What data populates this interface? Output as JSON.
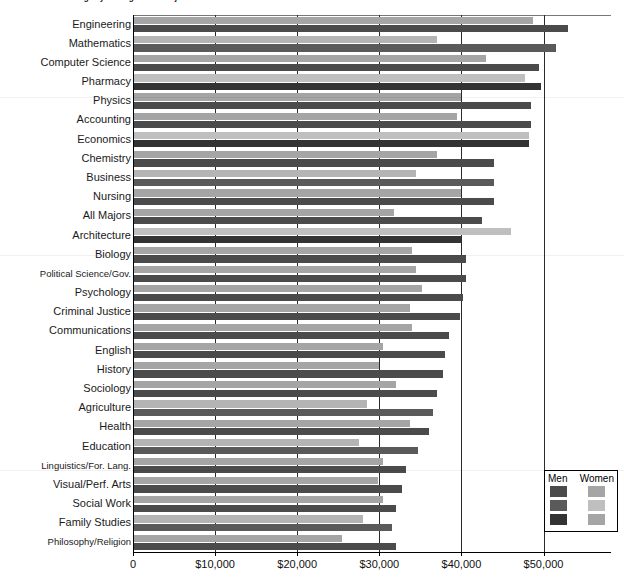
{
  "chart_data": {
    "type": "bar",
    "orientation": "horizontal",
    "title": "Median Annual Earnings by Undergraduate Major and Gender",
    "xlabel": "",
    "ylabel": "",
    "xlim": [
      0,
      55000
    ],
    "grid": true,
    "legend_position": "bottom-right",
    "legend_title_men": "Men",
    "legend_title_women": "Women",
    "xticks": [
      {
        "value": 0,
        "label": "0"
      },
      {
        "value": 10000,
        "label": "$10,000"
      },
      {
        "value": 20000,
        "label": "$20,000"
      },
      {
        "value": 30000,
        "label": "$30,000"
      },
      {
        "value": 40000,
        "label": "$40,000"
      },
      {
        "value": 50000,
        "label": "$50,000"
      }
    ],
    "categories": [
      "Engineering",
      "Mathematics",
      "Computer Science",
      "Pharmacy",
      "Physics",
      "Accounting",
      "Economics",
      "Chemistry",
      "Business",
      "Nursing",
      "All Majors",
      "Architecture",
      "Biology",
      "Political Science/Gov.",
      "Psychology",
      "Criminal Justice",
      "Communications",
      "English",
      "History",
      "Sociology",
      "Agriculture",
      "Health",
      "Education",
      "Linguistics/For. Lang.",
      "Visual/Perf. Arts",
      "Social Work",
      "Family Studies",
      "Philosophy/Religion"
    ],
    "series": [
      {
        "name": "Men",
        "color": "#4b4b4b",
        "values": [
          53000,
          51500,
          49500,
          49700,
          48500,
          48500,
          48200,
          44000,
          44000,
          44000,
          42500,
          40000,
          40500,
          40500,
          40200,
          39800,
          38500,
          38000,
          37800,
          37000,
          36500,
          36000,
          34700,
          33200,
          32800,
          32000,
          31500,
          32000
        ]
      },
      {
        "name": "Women",
        "color": "#a5a5a5",
        "values": [
          48700,
          37000,
          43000,
          47800,
          40000,
          39500,
          48200,
          37000,
          34500,
          40000,
          31800,
          46000,
          34000,
          34500,
          35200,
          33800,
          34000,
          30500,
          30000,
          32000,
          28500,
          33800,
          27500,
          30500,
          29800,
          30500,
          28000,
          25500
        ]
      }
    ]
  }
}
